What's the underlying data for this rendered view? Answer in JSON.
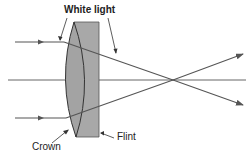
{
  "diagram": {
    "type": "achromatic-doublet-lens",
    "labels": {
      "white_light": "White light",
      "crown": "Crown",
      "flint": "Flint"
    },
    "colors": {
      "background": "#ffffff",
      "lens_fill": "#a8a8a8",
      "lens_stroke": "#333333",
      "ray": "#555555",
      "axis": "#666666",
      "text": "#222222"
    },
    "elements": [
      {
        "id": "optical-axis",
        "kind": "line"
      },
      {
        "id": "flint-element",
        "kind": "plano-concave lens (flint glass)"
      },
      {
        "id": "crown-element",
        "kind": "biconvex lens (crown glass)"
      },
      {
        "id": "ray-top",
        "kind": "light ray"
      },
      {
        "id": "ray-bottom",
        "kind": "light ray"
      }
    ]
  }
}
